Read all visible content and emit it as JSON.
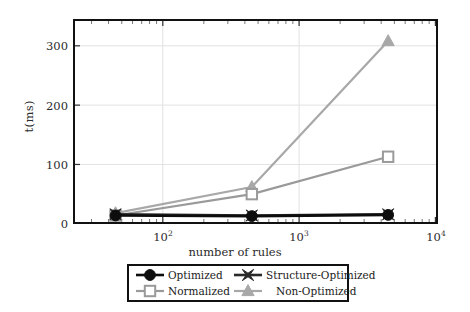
{
  "chart_data": {
    "type": "line",
    "title": "",
    "xlabel": "number of rules",
    "ylabel": "t(ms)",
    "xscale": "log",
    "yscale": "linear",
    "xlim": [
      30,
      10000
    ],
    "ylim": [
      0,
      345
    ],
    "grid": true,
    "legend_position": "below-axes",
    "xticks": [
      {
        "value": 100,
        "label": "10",
        "exponent": "2"
      },
      {
        "value": 1000,
        "label": "10",
        "exponent": "3"
      },
      {
        "value": 10000,
        "label": "10",
        "exponent": "4"
      }
    ],
    "yticks": [
      {
        "value": 0,
        "label": "0"
      },
      {
        "value": 100,
        "label": "100"
      },
      {
        "value": 200,
        "label": "200"
      },
      {
        "value": 300,
        "label": "300"
      }
    ],
    "x": [
      45,
      450,
      4500
    ],
    "series": [
      {
        "name": "Optimized",
        "marker": "filled-circle",
        "color": "#0d0d0d",
        "values": [
          14,
          13,
          15
        ]
      },
      {
        "name": "Structure-Optimized",
        "marker": "filled-x-star",
        "color": "#2a2a2a",
        "values": [
          16,
          14,
          16
        ]
      },
      {
        "name": "Normalized",
        "marker": "open-square",
        "color": "#9a9a9a",
        "values": [
          14,
          50,
          113
        ]
      },
      {
        "name": "Non-Optimized",
        "marker": "filled-triangle",
        "color": "#a8a8a8",
        "values": [
          18,
          62,
          308
        ]
      }
    ]
  },
  "axes": {
    "xlabel": "number of rules",
    "ylabel": "t(ms)"
  },
  "legend": {
    "entries": [
      {
        "label": "Optimized",
        "marker": "filled-circle",
        "color": "#0d0d0d"
      },
      {
        "label": "Structure-Optimized",
        "marker": "filled-x-star",
        "color": "#2a2a2a"
      },
      {
        "label": "Normalized",
        "marker": "open-square",
        "color": "#9a9a9a"
      },
      {
        "label": "Non-Optimized",
        "marker": "filled-triangle",
        "color": "#a8a8a8"
      }
    ]
  }
}
